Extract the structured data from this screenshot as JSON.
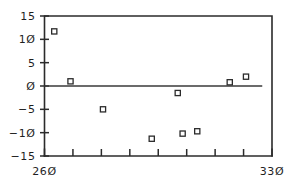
{
  "chart_data": {
    "type": "scatter",
    "title": "",
    "subtitle": "",
    "xlabel": "",
    "ylabel": "",
    "xlim": [
      260,
      330
    ],
    "ylim": [
      -15,
      15
    ],
    "grid": false,
    "legend": null,
    "marker": "open-square",
    "x": [
      263.0,
      268.0,
      278.0,
      293.0,
      301.0,
      302.5,
      307.0,
      317.0,
      322.0
    ],
    "y": [
      11.7,
      1.0,
      -5.0,
      -11.3,
      -1.5,
      -10.2,
      -9.7,
      0.8,
      2.0
    ],
    "points": [
      {
        "x": 263.0,
        "y": 11.7
      },
      {
        "x": 268.0,
        "y": 1.0
      },
      {
        "x": 278.0,
        "y": -5.0
      },
      {
        "x": 293.0,
        "y": -11.3
      },
      {
        "x": 301.0,
        "y": -1.5
      },
      {
        "x": 302.5,
        "y": -10.2
      },
      {
        "x": 307.0,
        "y": -9.7
      },
      {
        "x": 317.0,
        "y": 0.8
      },
      {
        "x": 322.0,
        "y": 2.0
      }
    ],
    "reference_line": {
      "orientation": "horizontal",
      "y": 0
    },
    "y_ticks": [
      15,
      10,
      5,
      0,
      -5,
      -10,
      -15
    ],
    "y_tick_labels": [
      "15",
      "1Ø",
      "5",
      "Ø",
      "−5",
      "−1Ø",
      "−15"
    ],
    "x_ticks": [
      260,
      268.75,
      277.5,
      286.25,
      295,
      303.75,
      312.5,
      321.25,
      330
    ],
    "x_tick_labels": [
      "26Ø",
      "",
      "",
      "",
      "",
      "",
      "",
      "",
      "33Ø"
    ],
    "x_labeled_ticks": [
      {
        "value": 260,
        "label": "26Ø"
      },
      {
        "value": 330,
        "label": "33Ø"
      }
    ]
  },
  "style": {
    "axis_color": "#2b2b2b",
    "marker_edge_color": "#2b2b2b",
    "marker_face_color": "#ffffff",
    "zero_line_color": "#3a3a3a",
    "background": "#ffffff",
    "text_color": "#1f1f1f"
  }
}
